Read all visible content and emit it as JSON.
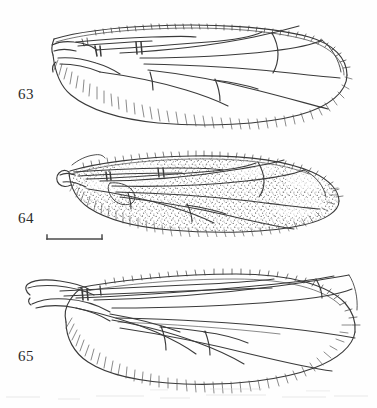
{
  "plate": {
    "title": "Insect wing venation plate",
    "background_color": "#fefefe",
    "ink_color": "#3a3a3a",
    "width": 377,
    "height": 408
  },
  "figures": [
    {
      "label": "63",
      "label_x": 18,
      "label_y": 87,
      "caption": "wing, hyaline membrane, fringed posterior margin",
      "stippled": false,
      "origin_x": 52,
      "origin_y": 10,
      "box_w": 300,
      "box_h": 120
    },
    {
      "label": "64",
      "label_x": 18,
      "label_y": 211,
      "caption": "wing, membrane stippled (infuscate), fringed margins",
      "stippled": true,
      "origin_x": 55,
      "origin_y": 148,
      "box_w": 290,
      "box_h": 86
    },
    {
      "label": "65",
      "label_x": 18,
      "label_y": 349,
      "caption": "wing, hyaline membrane, fringed posterior margin",
      "stippled": false,
      "origin_x": 24,
      "origin_y": 252,
      "box_w": 330,
      "box_h": 140
    }
  ],
  "scale_bar": {
    "name": "scale-bar",
    "x1": 47,
    "x2": 102,
    "y": 239,
    "tick_height": 5,
    "label": ""
  }
}
